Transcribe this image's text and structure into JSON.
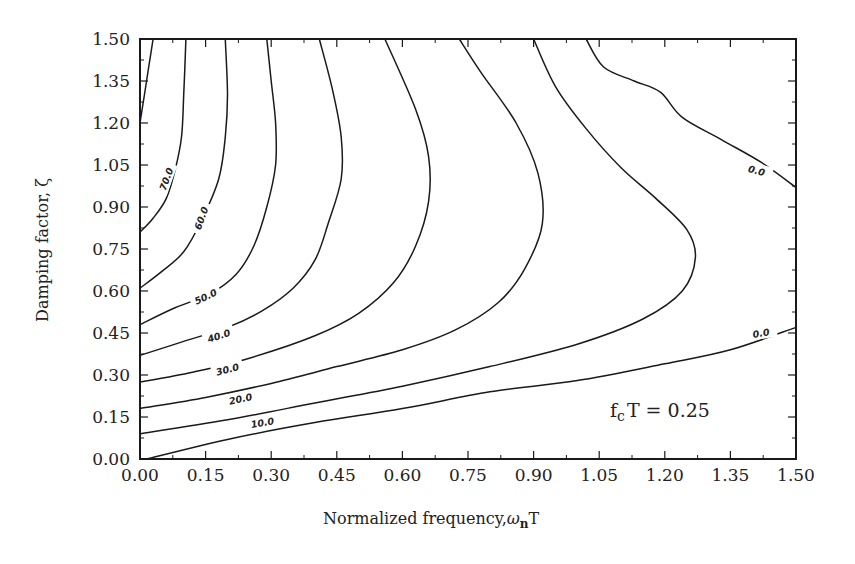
{
  "chart_data": {
    "type": "contour",
    "title": "",
    "xlabel": "Normalized frequency, ωnT",
    "xlabel_main": "Normalized frequency,",
    "xlabel_symbol": "ω",
    "xlabel_sub": "n",
    "xlabel_tail": "T",
    "ylabel": "Damping factor, ζ",
    "xlim": [
      0.0,
      1.5
    ],
    "ylim": [
      0.0,
      1.5
    ],
    "xticks": [
      "0.00",
      "0.15",
      "0.30",
      "0.45",
      "0.60",
      "0.75",
      "0.90",
      "1.05",
      "1.20",
      "1.35",
      "1.50"
    ],
    "yticks": [
      "0.00",
      "0.15",
      "0.30",
      "0.45",
      "0.60",
      "0.75",
      "0.90",
      "1.05",
      "1.20",
      "1.35",
      "1.50"
    ],
    "grid": false,
    "annotation": {
      "text_main": "f",
      "text_sub": "c",
      "text_tail": "T = 0.25",
      "x": 1.0,
      "y": 0.15
    },
    "contours": [
      {
        "level": 80.0,
        "label": "",
        "points": [
          [
            0.0,
            1.2
          ],
          [
            0.01,
            1.3
          ],
          [
            0.02,
            1.4
          ],
          [
            0.03,
            1.5
          ]
        ]
      },
      {
        "level": 70.0,
        "label": "70.0",
        "label_pos": [
          0.06,
          1.0
        ],
        "label_rot": -70,
        "points": [
          [
            0.0,
            0.81
          ],
          [
            0.03,
            0.86
          ],
          [
            0.06,
            0.93
          ],
          [
            0.08,
            1.03
          ],
          [
            0.095,
            1.15
          ],
          [
            0.1,
            1.3
          ],
          [
            0.105,
            1.5
          ]
        ]
      },
      {
        "level": 60.0,
        "label": "60.0",
        "label_pos": [
          0.14,
          0.86
        ],
        "label_rot": -70,
        "points": [
          [
            0.0,
            0.61
          ],
          [
            0.05,
            0.67
          ],
          [
            0.1,
            0.74
          ],
          [
            0.14,
            0.85
          ],
          [
            0.18,
            1.0
          ],
          [
            0.195,
            1.15
          ],
          [
            0.2,
            1.3
          ],
          [
            0.195,
            1.5
          ]
        ]
      },
      {
        "level": 50.0,
        "label": "50.0",
        "label_pos": [
          0.15,
          0.58
        ],
        "label_rot": -25,
        "points": [
          [
            0.0,
            0.48
          ],
          [
            0.08,
            0.54
          ],
          [
            0.16,
            0.59
          ],
          [
            0.22,
            0.66
          ],
          [
            0.26,
            0.76
          ],
          [
            0.29,
            0.9
          ],
          [
            0.31,
            1.05
          ],
          [
            0.31,
            1.2
          ],
          [
            0.3,
            1.35
          ],
          [
            0.29,
            1.5
          ]
        ]
      },
      {
        "level": 40.0,
        "label": "40.0",
        "label_pos": [
          0.18,
          0.44
        ],
        "label_rot": -18,
        "points": [
          [
            0.0,
            0.37
          ],
          [
            0.1,
            0.42
          ],
          [
            0.2,
            0.47
          ],
          [
            0.28,
            0.53
          ],
          [
            0.35,
            0.61
          ],
          [
            0.4,
            0.71
          ],
          [
            0.43,
            0.84
          ],
          [
            0.46,
            1.0
          ],
          [
            0.46,
            1.15
          ],
          [
            0.44,
            1.32
          ],
          [
            0.41,
            1.5
          ]
        ]
      },
      {
        "level": 30.0,
        "label": "30.0",
        "label_pos": [
          0.2,
          0.32
        ],
        "label_rot": -15,
        "points": [
          [
            0.0,
            0.275
          ],
          [
            0.12,
            0.31
          ],
          [
            0.25,
            0.36
          ],
          [
            0.4,
            0.44
          ],
          [
            0.5,
            0.52
          ],
          [
            0.58,
            0.63
          ],
          [
            0.63,
            0.76
          ],
          [
            0.66,
            0.92
          ],
          [
            0.66,
            1.08
          ],
          [
            0.63,
            1.25
          ],
          [
            0.56,
            1.5
          ]
        ]
      },
      {
        "level": 20.0,
        "label": "20.0",
        "label_pos": [
          0.23,
          0.215
        ],
        "label_rot": -12,
        "points": [
          [
            0.0,
            0.18
          ],
          [
            0.15,
            0.22
          ],
          [
            0.3,
            0.27
          ],
          [
            0.45,
            0.33
          ],
          [
            0.6,
            0.39
          ],
          [
            0.72,
            0.46
          ],
          [
            0.82,
            0.56
          ],
          [
            0.88,
            0.68
          ],
          [
            0.92,
            0.84
          ],
          [
            0.91,
            1.02
          ],
          [
            0.86,
            1.2
          ],
          [
            0.78,
            1.38
          ],
          [
            0.73,
            1.5
          ]
        ]
      },
      {
        "level": 10.0,
        "label": "10.0",
        "label_pos": [
          0.28,
          0.13
        ],
        "label_rot": -10,
        "points": [
          [
            0.0,
            0.09
          ],
          [
            0.2,
            0.14
          ],
          [
            0.4,
            0.2
          ],
          [
            0.6,
            0.26
          ],
          [
            0.8,
            0.33
          ],
          [
            1.0,
            0.41
          ],
          [
            1.15,
            0.5
          ],
          [
            1.24,
            0.6
          ],
          [
            1.27,
            0.72
          ],
          [
            1.25,
            0.82
          ],
          [
            1.18,
            0.93
          ],
          [
            1.1,
            1.04
          ],
          [
            1.02,
            1.18
          ],
          [
            0.95,
            1.33
          ],
          [
            0.9,
            1.5
          ]
        ]
      },
      {
        "level": 0.0,
        "label": "0.0",
        "label_pos": [
          1.41,
          1.03
        ],
        "label_rot": 15,
        "points": [
          [
            1.02,
            1.5
          ],
          [
            1.06,
            1.4
          ],
          [
            1.13,
            1.35
          ],
          [
            1.19,
            1.31
          ],
          [
            1.24,
            1.22
          ],
          [
            1.33,
            1.14
          ],
          [
            1.42,
            1.06
          ],
          [
            1.5,
            0.97
          ]
        ]
      },
      {
        "level": 0.0,
        "label": "0.0",
        "label_pos": [
          1.42,
          0.45
        ],
        "label_rot": -10,
        "points": [
          [
            0.015,
            0.0
          ],
          [
            0.2,
            0.07
          ],
          [
            0.4,
            0.13
          ],
          [
            0.6,
            0.18
          ],
          [
            0.8,
            0.24
          ],
          [
            1.0,
            0.28
          ],
          [
            1.2,
            0.34
          ],
          [
            1.35,
            0.39
          ],
          [
            1.5,
            0.47
          ]
        ]
      }
    ]
  }
}
